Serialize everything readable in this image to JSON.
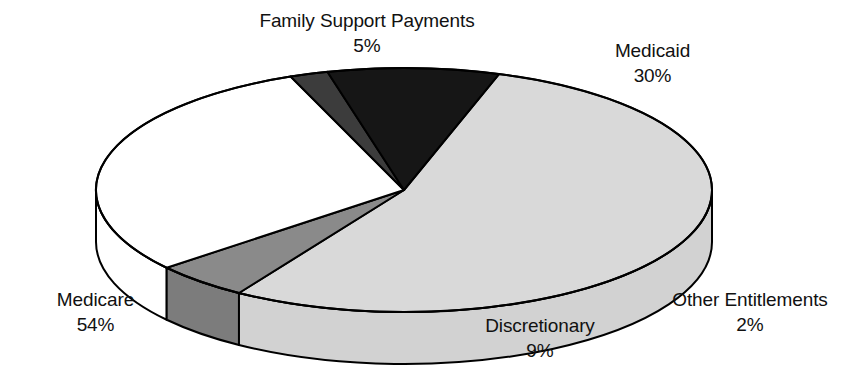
{
  "chart_data": {
    "type": "pie",
    "title": "",
    "subtitle": "",
    "xlabel": "",
    "ylabel": "",
    "legend_position": "none",
    "grid": false,
    "three_d": true,
    "units": "percent",
    "categories": [
      "Medicare",
      "Family Support Payments",
      "Medicaid",
      "Other Entitlements",
      "Discretionary"
    ],
    "values": [
      54,
      5,
      30,
      2,
      9
    ],
    "slices": [
      {
        "label": "Medicare",
        "value": 54,
        "value_text": "54%",
        "color": "#d9d9d9",
        "side_color": "#d2d2d2"
      },
      {
        "label": "Family Support Payments",
        "value": 5,
        "value_text": "5%",
        "color": "#8a8a8a",
        "side_color": "#7c7c7c"
      },
      {
        "label": "Medicaid",
        "value": 30,
        "value_text": "30%",
        "color": "#ffffff",
        "side_color": "#ffffff"
      },
      {
        "label": "Other Entitlements",
        "value": 2,
        "value_text": "2%",
        "color": "#3c3c3c",
        "side_color": "#3c3c3c"
      },
      {
        "label": "Discretionary",
        "value": 9,
        "value_text": "9%",
        "color": "#161616",
        "side_color": "#161616"
      }
    ],
    "colors": {
      "medicare": "#d9d9d9",
      "family_support": "#8a8a8a",
      "medicaid": "#ffffff",
      "other_entitlements": "#3c3c3c",
      "discretionary": "#161616",
      "outline": "#000000",
      "background": "#ffffff",
      "text": "#111111"
    }
  },
  "labels": {
    "family_support": {
      "name": "Family Support Payments",
      "value": "5%"
    },
    "medicaid": {
      "name": "Medicaid",
      "value": "30%"
    },
    "other_entitlements": {
      "name": "Other Entitlements",
      "value": "2%"
    },
    "discretionary": {
      "name": "Discretionary",
      "value": "9%"
    },
    "medicare": {
      "name": "Medicare",
      "value": "54%"
    }
  }
}
